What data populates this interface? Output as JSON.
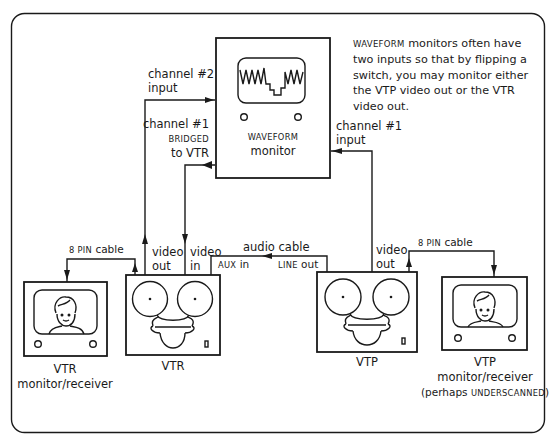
{
  "diagram": {
    "note": {
      "smallcaps_word": "WAVEFORM",
      "text": " monitors often have two inputs so that by flipping a switch, you may monitor either the VTP video out or the VTR video out."
    },
    "waveform_monitor": {
      "label_smallcaps": "WAVEFORM",
      "label": "monitor"
    },
    "labels": {
      "channel2_line1": "channel #2",
      "channel2_line2": "input",
      "channel1_bridged_line1": "channel #1",
      "channel1_bridged_line2": "BRIDGED",
      "channel1_bridged_line3": "to VTR",
      "channel1_input_line1": "channel #1",
      "channel1_input_line2": "input",
      "vtr_video_out_1": "video",
      "vtr_video_out_2": "out",
      "vtr_video_in_1": "video",
      "vtr_video_in_2": "in",
      "audio_cable": "audio cable",
      "aux_in_smallcaps": "AUX",
      "aux_in": " in",
      "line_out_smallcaps": "LINE",
      "line_out": " out",
      "vtp_video_out_1": "video",
      "vtp_video_out_2": "out",
      "vtr_cable_smallcaps": "8 PIN",
      "vtr_cable": " cable",
      "vtp_cable_smallcaps": "8 PIN",
      "vtp_cable": " cable"
    },
    "devices": {
      "vtr_monitor_line1": "VTR",
      "vtr_monitor_line2": "monitor/receiver",
      "vtr": "VTR",
      "vtp": "VTP",
      "vtp_monitor_line1": "VTP",
      "vtp_monitor_line2": "monitor/receiver",
      "vtp_monitor_line3_pre": "(perhaps ",
      "vtp_monitor_line3_smallcaps": "UNDERSCANNED",
      "vtp_monitor_line3_post": ")"
    }
  }
}
